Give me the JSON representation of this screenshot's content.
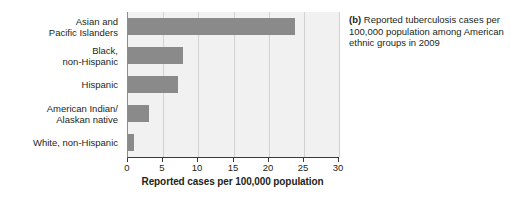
{
  "caption": {
    "tag": "(b)",
    "text": "Reported tuberculosis cases per 100,000 population among American ethnic groups in 2009"
  },
  "chart_data": {
    "type": "bar",
    "orientation": "horizontal",
    "title": "",
    "subtitle": "",
    "categories": [
      "Asian and\nPacific Islanders",
      "Black,\nnon-Hispanic",
      "Hispanic",
      "American Indian/\nAlaskan native",
      "White, non-Hispanic"
    ],
    "values": [
      23.8,
      7.8,
      7.1,
      3.0,
      0.8
    ],
    "xlabel": "Reported cases per 100,000 population",
    "ylabel": "",
    "xlim": [
      0,
      30
    ],
    "xticks": [
      0,
      5,
      10,
      15,
      20,
      25,
      30
    ],
    "xtick_labels": [
      "0",
      "5",
      "10",
      "15",
      "20",
      "25",
      "30"
    ],
    "grid": "vertical",
    "legend": "none",
    "bar_color": "#8a8a8a",
    "plot_background": "#f1f1f1"
  }
}
